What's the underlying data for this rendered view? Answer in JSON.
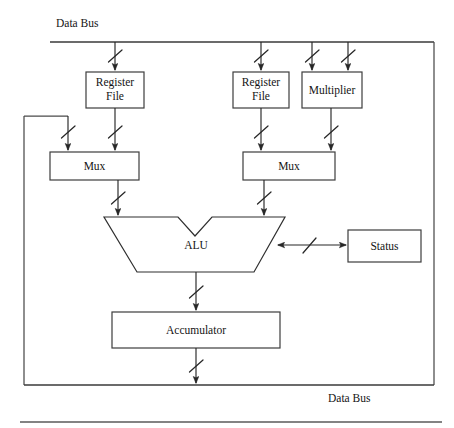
{
  "figure": {
    "background_color": "#ffffff",
    "line_color": "#272727",
    "box_fill": "#ffffff"
  },
  "labels": {
    "data_bus_top": "Data Bus",
    "data_bus_bottom": "Data Bus",
    "register_file_left": "Register File",
    "register_file_left_line1": "Register",
    "register_file_left_line2": "File",
    "register_file_right_line1": "Register",
    "register_file_right_line2": "File",
    "multiplier": "Multiplier",
    "mux_left": "Mux",
    "mux_right": "Mux",
    "alu": "ALU",
    "status": "Status",
    "accumulator": "Accumulator"
  },
  "blocks": [
    {
      "id": "register-file-left",
      "label": "Register File",
      "x": 86,
      "y": 72,
      "w": 58,
      "h": 36
    },
    {
      "id": "register-file-right",
      "label": "Register File",
      "x": 233,
      "y": 72,
      "w": 56,
      "h": 36
    },
    {
      "id": "multiplier",
      "label": "Multiplier",
      "x": 302,
      "y": 72,
      "w": 60,
      "h": 36
    },
    {
      "id": "mux-left",
      "label": "Mux",
      "x": 50,
      "y": 152,
      "w": 89,
      "h": 28
    },
    {
      "id": "mux-right",
      "label": "Mux",
      "x": 243,
      "y": 152,
      "w": 92,
      "h": 28
    },
    {
      "id": "status",
      "label": "Status",
      "x": 348,
      "y": 230,
      "w": 73,
      "h": 32
    },
    {
      "id": "accumulator",
      "label": "Accumulator",
      "x": 112,
      "y": 312,
      "w": 168,
      "h": 36
    }
  ],
  "alu": {
    "label": "ALU",
    "top_left_x": 104,
    "top_right_x": 285,
    "top_y": 217,
    "bottom_left_x": 137,
    "bottom_right_x": 254,
    "bottom_y": 272,
    "notch_left_x": 178,
    "notch_right_x": 212,
    "notch_bottom_y": 236
  },
  "buses": {
    "top_bus_y": 42,
    "top_bus_x1": 50,
    "top_bus_x2": 434,
    "bottom_bus_y": 385,
    "bottom_bus_x1": 50,
    "bottom_bus_x2": 434,
    "footer_rule_y": 422,
    "footer_rule_x1": 20,
    "footer_rule_x2": 442
  },
  "frame": {
    "left_x": 24,
    "right_x": 434,
    "top_y": 42,
    "bottom_y": 385,
    "feedback_top_y": 116,
    "feedback_right_x": 68
  },
  "connections": [
    {
      "id": "bus-to-regfile-left",
      "from": "top-data-bus",
      "to": "register-file-left",
      "x": 115,
      "y1": 42,
      "y2": 72,
      "tick": true,
      "arrow": true
    },
    {
      "id": "bus-to-regfile-right",
      "from": "top-data-bus",
      "to": "register-file-right",
      "x": 261,
      "y1": 42,
      "y2": 72,
      "tick": true,
      "arrow": true
    },
    {
      "id": "bus-to-multiplier-a",
      "from": "top-data-bus",
      "to": "multiplier",
      "x": 312,
      "y1": 42,
      "y2": 72,
      "tick": true,
      "arrow": true
    },
    {
      "id": "bus-to-multiplier-b",
      "from": "top-data-bus",
      "to": "multiplier",
      "x": 348,
      "y1": 42,
      "y2": 72,
      "tick": true,
      "arrow": true
    },
    {
      "id": "regfile-left-to-mux",
      "from": "register-file-left",
      "to": "mux-left",
      "x": 115,
      "y1": 108,
      "y2": 152,
      "tick": true,
      "arrow": true
    },
    {
      "id": "feedback-to-mux-left",
      "from": "accumulator-return",
      "to": "mux-left",
      "x": 68,
      "y1": 116,
      "y2": 152,
      "tick": true,
      "arrow": true
    },
    {
      "id": "regfile-right-to-mux",
      "from": "register-file-right",
      "to": "mux-right",
      "x": 261,
      "y1": 108,
      "y2": 152,
      "tick": true,
      "arrow": true
    },
    {
      "id": "multiplier-to-mux",
      "from": "multiplier",
      "to": "mux-right",
      "x": 331,
      "y1": 108,
      "y2": 152,
      "tick": true,
      "arrow": true
    },
    {
      "id": "mux-left-to-alu",
      "from": "mux-left",
      "to": "alu",
      "x": 118,
      "y1": 180,
      "y2": 217,
      "tick": true,
      "arrow": true
    },
    {
      "id": "mux-right-to-alu",
      "from": "mux-right",
      "to": "alu",
      "x": 264,
      "y1": 180,
      "y2": 217,
      "tick": true,
      "arrow": true
    },
    {
      "id": "alu-to-accumulator",
      "from": "alu",
      "to": "accumulator",
      "x": 196,
      "y1": 272,
      "y2": 312,
      "tick": true,
      "arrow": true
    },
    {
      "id": "accumulator-to-bus",
      "from": "accumulator",
      "to": "bottom-data-bus",
      "x": 196,
      "y1": 348,
      "y2": 385,
      "tick": true,
      "arrow": true
    },
    {
      "id": "alu-status-link",
      "from": "alu",
      "to": "status",
      "y": 245,
      "x1": 276,
      "x2": 348,
      "tick": true,
      "arrow": "both"
    }
  ]
}
